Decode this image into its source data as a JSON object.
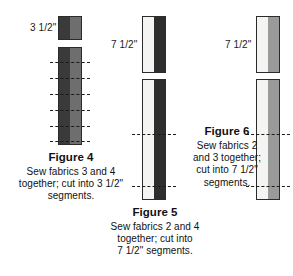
{
  "figures": [
    {
      "id": "figure-4",
      "title": "Figure 4",
      "body": "Sew fabrics 3 and 4 together; cut into 3 1/2\" segments.",
      "dimension_label": "3 1/2\"",
      "segment_bands": [
        "#3a3a3a",
        "#6e6e6e"
      ],
      "strip_bands": [
        "#3a3a3a",
        "#6e6e6e"
      ],
      "cut_count": 6
    },
    {
      "id": "figure-5",
      "title": "Figure 5",
      "body": "Sew fabrics 2 and 4 together; cut into 7 1/2\" segments.",
      "dimension_label": "7 1/2\"",
      "segment_bands": [
        "#f4f4f2",
        "#2e2e2e"
      ],
      "strip_bands": [
        "#f4f4f2",
        "#2e2e2e"
      ],
      "cut_count": 2
    },
    {
      "id": "figure-6",
      "title": "Figure 6",
      "body": "Sew fabrics 2 and 3 together; cut into 7 1/2\" segments.",
      "dimension_label": "7 1/2\"",
      "segment_bands": [
        "#f4f4f2",
        "#9a9a9a"
      ],
      "strip_bands": [
        "#f4f4f2",
        "#9a9a9a"
      ],
      "cut_count": 2
    }
  ],
  "fig4": {
    "title": "Figure 4",
    "body_line1": "Sew fabrics 3 and 4",
    "body_line2": "together; cut into 3 1/2\"",
    "body_line3": "segments.",
    "dimension_label": "3 1/2\""
  },
  "fig5": {
    "title": "Figure 5",
    "body_line1": "Sew fabrics 2 and 4",
    "body_line2": "together; cut into",
    "body_line3": "7 1/2\" segments.",
    "dimension_label": "7 1/2\""
  },
  "fig6": {
    "title": "Figure 6",
    "body_line1": "Sew fabrics 2",
    "body_line2": "and 3 together;",
    "body_line3": "cut into 7 1/2\"",
    "body_line4": "segments.",
    "dimension_label": "7 1/2\""
  },
  "colors": {
    "fabric_dark": "#3a3a3a",
    "fabric_medium_gray": "#6e6e6e",
    "fabric_very_dark": "#2e2e2e",
    "fabric_light": "#f4f4f2",
    "fabric_gray": "#9a9a9a",
    "outline": "#2b2b2b",
    "text": "#111111",
    "background": "#ffffff"
  }
}
